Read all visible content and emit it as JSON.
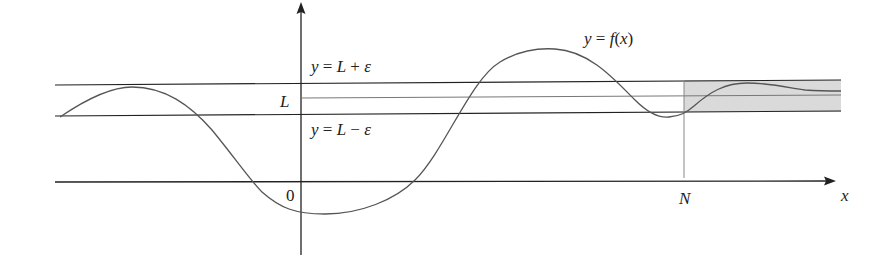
{
  "figure": {
    "labels": {
      "curve": "y = f(x)",
      "upper_band": "y = L + ε",
      "lower_band": "y = L − ε",
      "limit": "L",
      "origin": "0",
      "N": "N",
      "x_axis": "x"
    },
    "colors": {
      "line": "#222222",
      "curve": "#555555",
      "limit_line": "#777777",
      "shade": "#d9d9d9"
    }
  }
}
